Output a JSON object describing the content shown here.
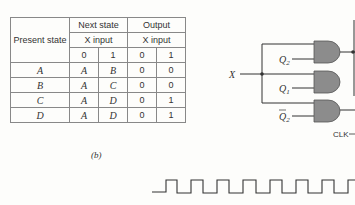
{
  "table": {
    "header": {
      "present_state": "Present state",
      "next_state": "Next state",
      "output": "Output",
      "x_input": "X input",
      "x_values": [
        "0",
        "1",
        "0",
        "1"
      ]
    },
    "rows": [
      {
        "present": "A",
        "next0": "A",
        "next1": "B",
        "out0": "0",
        "out1": "0"
      },
      {
        "present": "B",
        "next0": "A",
        "next1": "C",
        "out0": "0",
        "out1": "0"
      },
      {
        "present": "C",
        "next0": "A",
        "next1": "D",
        "out0": "0",
        "out1": "1"
      },
      {
        "present": "D",
        "next0": "A",
        "next1": "D",
        "out0": "0",
        "out1": "1"
      }
    ]
  },
  "caption": "(b)",
  "circuit": {
    "input_label": "X",
    "gate_inputs": [
      "Q2",
      "Q1",
      "Q̄2"
    ],
    "clock_label": "CLK",
    "gate_fill": "#8c8c8c"
  }
}
